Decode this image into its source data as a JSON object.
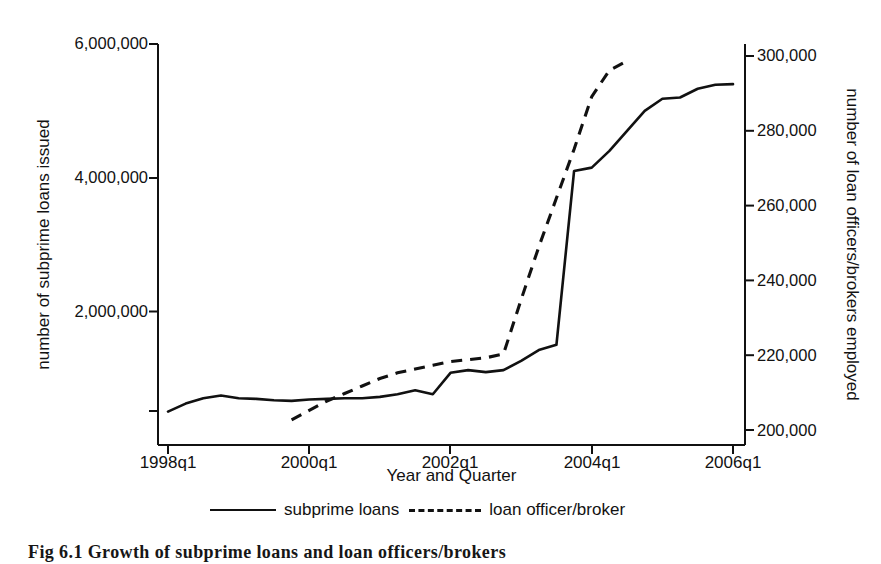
{
  "caption": "Fig 6.1   Growth of subprime loans and loan officers/brokers",
  "axes": {
    "left_title": "number of subprime loans issued",
    "right_title": "number of loan officers/brokers employed",
    "x_title": "Year and Quarter",
    "left_ticks": [
      "",
      "2,000,000",
      "4,000,000",
      "6,000,000"
    ],
    "right_ticks": [
      "200,000",
      "220,000",
      "240,000",
      "260,000",
      "280,000",
      "300,000"
    ],
    "x_ticks": [
      "1998q1",
      "2000q1",
      "2002q1",
      "2004q1",
      "2006q1"
    ]
  },
  "legend": {
    "items": [
      {
        "label": "subprime loans",
        "style": "solid"
      },
      {
        "label": "loan officer/broker",
        "style": "dashed"
      }
    ]
  },
  "chart_data": {
    "type": "line",
    "title": "Growth of subprime loans and loan officers/brokers",
    "xlabel": "Year and Quarter",
    "ylabel": "number of subprime loans issued",
    "y2label": "number of loan officers/brokers employed",
    "grid": false,
    "legend_position": "bottom",
    "xlim": [
      "1998q1",
      "2006q1"
    ],
    "ylim": [
      0,
      6000000
    ],
    "y2lim": [
      193300,
      300000
    ],
    "x": [
      "1998q1",
      "1998q2",
      "1998q3",
      "1998q4",
      "1999q1",
      "1999q2",
      "1999q3",
      "1999q4",
      "2000q1",
      "2000q2",
      "2000q3",
      "2000q4",
      "2001q1",
      "2001q2",
      "2001q3",
      "2001q4",
      "2002q1",
      "2002q2",
      "2002q3",
      "2002q4",
      "2003q1",
      "2003q2",
      "2003q3",
      "2003q4",
      "2004q1",
      "2004q2",
      "2004q3",
      "2004q4",
      "2005q1",
      "2005q2",
      "2005q3",
      "2005q4",
      "2006q1"
    ],
    "series": [
      {
        "name": "subprime loans",
        "axis": "left",
        "style": "solid",
        "values": [
          500000,
          620000,
          700000,
          740000,
          700000,
          690000,
          670000,
          660000,
          680000,
          690000,
          700000,
          700000,
          720000,
          760000,
          820000,
          760000,
          1080000,
          1120000,
          1090000,
          1120000,
          1260000,
          1420000,
          1500000,
          4100000,
          4150000,
          4400000,
          4700000,
          5000000,
          5180000,
          5200000,
          5330000,
          5390000,
          5400000
        ]
      },
      {
        "name": "loan officer/broker",
        "axis": "right",
        "style": "dashed",
        "values": [
          null,
          null,
          null,
          null,
          null,
          null,
          null,
          200000,
          202500,
          205000,
          207000,
          209000,
          211000,
          212500,
          213500,
          214500,
          215500,
          216000,
          216500,
          217500,
          232000,
          246000,
          259000,
          272000,
          286000,
          293000,
          295500,
          null,
          null,
          null,
          null,
          null,
          null
        ]
      }
    ]
  }
}
